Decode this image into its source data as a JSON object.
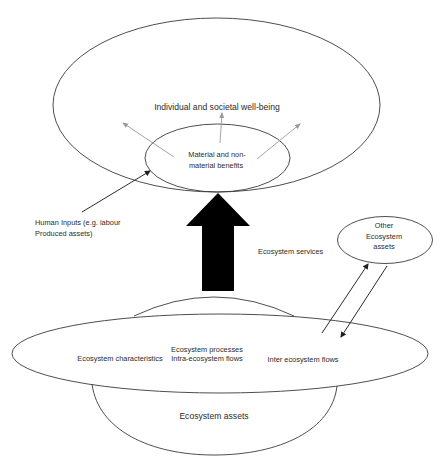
{
  "diagram": {
    "title": "",
    "nodes": {
      "wellbeing": {
        "label": "Individual and societal well-being"
      },
      "benefits": {
        "line1": "Material and non-",
        "line2": "material benefits"
      },
      "human_inputs": {
        "line1": "Human Inputs (e.g. labour",
        "line2": "Produced assets)"
      },
      "services": {
        "label": "Ecosystem services"
      },
      "other_assets": {
        "line1": "Other",
        "line2": "Ecosystem",
        "line3": "assets"
      },
      "characteristics": {
        "label": "Ecosystem characteristics"
      },
      "processes": {
        "line1": "Ecosystem processes",
        "line2": "Intra-ecosystem flows"
      },
      "inter_flows": {
        "label": "Inter ecosystem flows"
      },
      "assets": {
        "label": "Ecosystem assets"
      }
    },
    "edges": [
      {
        "from": "benefits",
        "to": "wellbeing",
        "style": "gray-arrow",
        "count": 3
      },
      {
        "from": "human_inputs",
        "to": "benefits",
        "style": "dark-arrow"
      },
      {
        "from": "assets",
        "to": "benefits",
        "style": "thick-block-arrow",
        "label": "Ecosystem services"
      },
      {
        "from": "inter_flows",
        "to": "other_assets",
        "style": "dark-arrow"
      },
      {
        "from": "other_assets",
        "to": "inter_flows",
        "style": "dark-arrow"
      }
    ],
    "colors": {
      "stroke": "#3a3a3a",
      "gray_arrow": "#9a9a9a",
      "block_arrow": "#000000",
      "text": "#2b2b2b",
      "background": "#ffffff"
    }
  }
}
